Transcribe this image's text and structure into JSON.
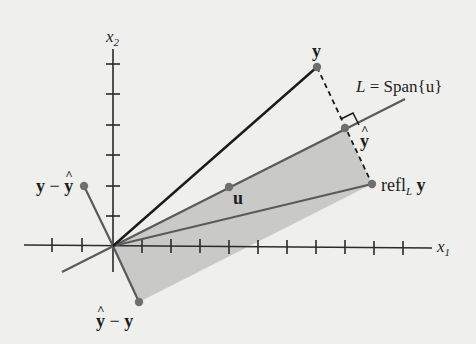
{
  "diagram": {
    "axes": {
      "x1_label": "x",
      "x1_sub": "1",
      "x2_label": "x",
      "x2_sub": "2",
      "x1_tick_count_positive": 11,
      "x1_tick_count_negative": 2,
      "x2_tick_count_positive": 6
    },
    "line_label": {
      "L": "L",
      "equals": " = Span{",
      "u": "u",
      "close": "}"
    },
    "points": {
      "y": "y",
      "y_hat": "y",
      "u": "u",
      "refl_prefix": "refl",
      "refl_sub": "L",
      "refl_vec": "y",
      "y_minus_yhat_a": "y",
      "y_minus_yhat_op": " − ",
      "y_minus_yhat_b": "y",
      "yhat_minus_y_a": "y",
      "yhat_minus_y_op": " − ",
      "yhat_minus_y_b": "y"
    },
    "colors": {
      "background": "#efefed",
      "axis": "#2a2a2a",
      "vector_y": "#1a1a1a",
      "line_L": "#5a5a5a",
      "shade": "#c9c9c7",
      "point": "#6f6f6f"
    }
  }
}
